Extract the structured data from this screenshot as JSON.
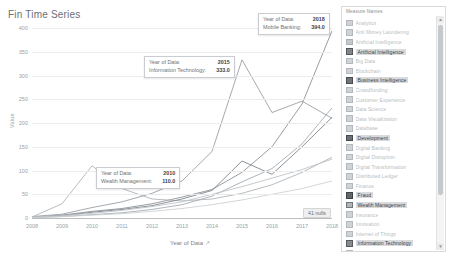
{
  "chart_data": {
    "type": "line",
    "title": "Fin Time Series",
    "xlabel": "Year of Data",
    "ylabel": "Value",
    "sort_glyph": "↗",
    "xlim": [
      2008,
      2018
    ],
    "ylim": [
      0,
      400
    ],
    "ytick_values": [
      0,
      50,
      100,
      150,
      200,
      250,
      300,
      350,
      400
    ],
    "ytick_labels": [
      "0",
      "50",
      "100",
      "150",
      "200",
      "250",
      "300",
      "350",
      "400"
    ],
    "xtick_labels": [
      "2008",
      "2009",
      "2010",
      "2011",
      "2012",
      "2013",
      "2014",
      "2015",
      "2016",
      "2017",
      "2018"
    ],
    "x": [
      2008,
      2009,
      2010,
      2011,
      2012,
      2013,
      2014,
      2015,
      2016,
      2017,
      2018
    ],
    "grid": true,
    "legend_position": "right",
    "null_note": "41 nulls",
    "series": [
      {
        "name": "Mobile Banking",
        "color": "#8d9399",
        "values": [
          2,
          6,
          14,
          20,
          30,
          44,
          60,
          96,
          150,
          240,
          394
        ]
      },
      {
        "name": "Information Technology",
        "color": "#9aa0a6",
        "values": [
          3,
          8,
          22,
          34,
          52,
          78,
          140,
          333,
          222,
          246,
          210
        ]
      },
      {
        "name": "Wealth Management",
        "color": "#b0b5ba",
        "values": [
          2,
          30,
          110,
          62,
          40,
          36,
          40,
          52,
          70,
          96,
          128
        ]
      },
      {
        "name": "Business Intelligence",
        "color": "#7f858b",
        "values": [
          1,
          5,
          12,
          18,
          26,
          40,
          58,
          120,
          92,
          150,
          212
        ]
      },
      {
        "name": "Artificial Intelligence",
        "color": "#a6abb0",
        "values": [
          1,
          3,
          7,
          11,
          18,
          28,
          46,
          76,
          104,
          156,
          232
        ]
      },
      {
        "name": "Development",
        "color": "#c0c4c8",
        "values": [
          2,
          5,
          10,
          16,
          24,
          34,
          50,
          66,
          84,
          102,
          124
        ]
      },
      {
        "name": "Fraud",
        "color": "#ced2d5",
        "values": [
          1,
          3,
          6,
          9,
          14,
          20,
          28,
          38,
          50,
          62,
          78
        ]
      }
    ]
  },
  "tooltips": [
    {
      "id": "tt-1",
      "key1": "Year of Data:",
      "val1": "2018",
      "key2": "Mobile Banking:",
      "val2": "394.0"
    },
    {
      "id": "tt-2",
      "key1": "Year of Data:",
      "val1": "2015",
      "key2": "Information Technology:",
      "val2": "333.0"
    },
    {
      "id": "tt-3",
      "key1": "Year of Data:",
      "val1": "2010",
      "key2": "Wealth Management:",
      "val2": "110.0"
    }
  ],
  "legend": {
    "title": "Measure Names",
    "scrollbar": {
      "up": "▲",
      "down": "▼"
    },
    "items": [
      {
        "label": "Analytics",
        "color": "#cfd3d7",
        "highlighted": false
      },
      {
        "label": "Anti Money Laundering",
        "color": "#cfd3d7",
        "highlighted": false
      },
      {
        "label": "Artificial Intelligence",
        "color": "#c4c8cc",
        "highlighted": false
      },
      {
        "label": "Artificial Intelligence",
        "color": "#7f858b",
        "highlighted": true
      },
      {
        "label": "Big Data",
        "color": "#cfd3d7",
        "highlighted": false
      },
      {
        "label": "Blockchain",
        "color": "#cfd3d7",
        "highlighted": false
      },
      {
        "label": "Business Intelligence",
        "color": "#6f757b",
        "highlighted": true
      },
      {
        "label": "Crowdfunding",
        "color": "#cfd3d7",
        "highlighted": false
      },
      {
        "label": "Customer Experience",
        "color": "#cfd3d7",
        "highlighted": false
      },
      {
        "label": "Data Science",
        "color": "#cfd3d7",
        "highlighted": false
      },
      {
        "label": "Data Visualization",
        "color": "#cfd3d7",
        "highlighted": false
      },
      {
        "label": "Database",
        "color": "#cfd3d7",
        "highlighted": false
      },
      {
        "label": "Development",
        "color": "#6a7076",
        "highlighted": true
      },
      {
        "label": "Digital Banking",
        "color": "#cfd3d7",
        "highlighted": false
      },
      {
        "label": "Digital Disruption",
        "color": "#cfd3d7",
        "highlighted": false
      },
      {
        "label": "Digital Transformation",
        "color": "#cfd3d7",
        "highlighted": false
      },
      {
        "label": "Distributed Ledger",
        "color": "#cfd3d7",
        "highlighted": false
      },
      {
        "label": "Finance",
        "color": "#cfd3d7",
        "highlighted": false
      },
      {
        "label": "Fraud",
        "color": "#60666c",
        "highlighted": true
      },
      {
        "label": "Wealth Management",
        "color": "#b0b5ba",
        "highlighted": true
      },
      {
        "label": "Insurance",
        "color": "#cfd3d7",
        "highlighted": false
      },
      {
        "label": "Innovation",
        "color": "#cfd3d7",
        "highlighted": false
      },
      {
        "label": "Internet of Things",
        "color": "#cfd3d7",
        "highlighted": false
      },
      {
        "label": "Information Technology",
        "color": "#868c92",
        "highlighted": true
      },
      {
        "label": "Knowledge Sharing",
        "color": "#cfd3d7",
        "highlighted": false
      },
      {
        "label": "Learning",
        "color": "#cfd3d7",
        "highlighted": false
      },
      {
        "label": "Machine Learning",
        "color": "#cfd3d7",
        "highlighted": false
      },
      {
        "label": "Microfinance",
        "color": "#cfd3d7",
        "highlighted": false
      },
      {
        "label": "Mobile Banking",
        "color": "#8d9399",
        "highlighted": true
      }
    ]
  }
}
